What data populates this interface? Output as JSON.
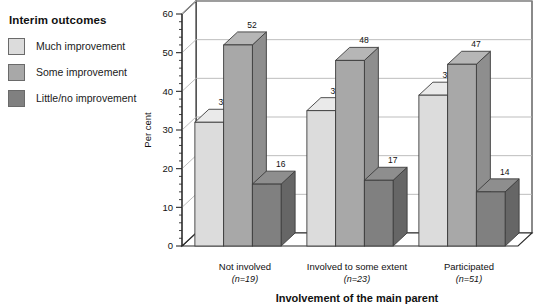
{
  "legend": {
    "title": "Interim outcomes",
    "items": [
      {
        "label": "Much improvement",
        "color": "#dcdcdc"
      },
      {
        "label": "Some improvement",
        "color": "#a8a8a8"
      },
      {
        "label": "Little/no improvement",
        "color": "#808080"
      }
    ]
  },
  "chart_data": {
    "type": "bar",
    "title": "",
    "xlabel": "Involvement of the main parent",
    "ylabel": "Per cent",
    "ylim": [
      0,
      60
    ],
    "ytick_step": 10,
    "yminor_step": 2,
    "yticks": [
      "0",
      "10",
      "20",
      "30",
      "40",
      "50",
      "60"
    ],
    "grid": true,
    "legend_position": "top-left-outside",
    "style": "3d-clustered-column",
    "categories": [
      "Not involved",
      "Involved to some extent",
      "Participated"
    ],
    "category_sublabels": [
      "(n=19)",
      "(n=23)",
      "(n=51)"
    ],
    "series": [
      {
        "name": "Much improvement",
        "color": "#dcdcdc",
        "values": [
          32,
          35,
          39
        ]
      },
      {
        "name": "Some improvement",
        "color": "#a8a8a8",
        "values": [
          52,
          48,
          47
        ]
      },
      {
        "name": "Little/no improvement",
        "color": "#808080",
        "values": [
          16,
          17,
          14
        ]
      }
    ],
    "data_labels": [
      [
        "32",
        "52",
        "16"
      ],
      [
        "35",
        "48",
        "17"
      ],
      [
        "39",
        "47",
        "14"
      ]
    ]
  }
}
